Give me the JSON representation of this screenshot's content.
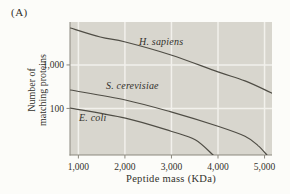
{
  "figure_label": "(A)",
  "colors": {
    "page_bg": "#fcfcf9",
    "plot_bg": "#d8d6ce",
    "grid": "#f2f1ec",
    "axis": "#8b887e",
    "curve": "#4f4d45",
    "text": "#33312c"
  },
  "chart_data": {
    "type": "line",
    "title": "",
    "xlabel": "Peptide mass (KDa)",
    "ylabel": "Number of matching proteins",
    "ylabel_lines": [
      "Number of",
      "matching proteins"
    ],
    "x_scale": "linear",
    "y_scale": "log",
    "xlim": [
      820,
      5160
    ],
    "ylim": [
      8.5,
      9700
    ],
    "grid": true,
    "legend_position": "inline-labels",
    "x_ticks": [
      {
        "value": 1000,
        "label": "1,000"
      },
      {
        "value": 2000,
        "label": "2,000"
      },
      {
        "value": 3000,
        "label": "3,000"
      },
      {
        "value": 4000,
        "label": "4,000"
      },
      {
        "value": 5000,
        "label": "5,000"
      }
    ],
    "y_ticks": [
      {
        "value": 1000,
        "label": "1,000"
      },
      {
        "value": 100,
        "label": "100"
      }
    ],
    "series": [
      {
        "name": "H. sapiens",
        "points": [
          [
            830,
            7050
          ],
          [
            1470,
            4380
          ],
          [
            2010,
            3360
          ],
          [
            2990,
            1690
          ],
          [
            4000,
            690
          ],
          [
            4580,
            430
          ],
          [
            5160,
            225
          ]
        ]
      },
      {
        "name": "S. cerevisiae",
        "points": [
          [
            830,
            265
          ],
          [
            2010,
            156
          ],
          [
            2990,
            83
          ],
          [
            4000,
            39
          ],
          [
            4580,
            23
          ],
          [
            4860,
            14
          ],
          [
            5050,
            8.5
          ]
        ]
      },
      {
        "name": "E. coli",
        "points": [
          [
            830,
            102
          ],
          [
            2010,
            60
          ],
          [
            2990,
            30
          ],
          [
            3510,
            19
          ],
          [
            3895,
            8.5
          ]
        ]
      }
    ]
  }
}
